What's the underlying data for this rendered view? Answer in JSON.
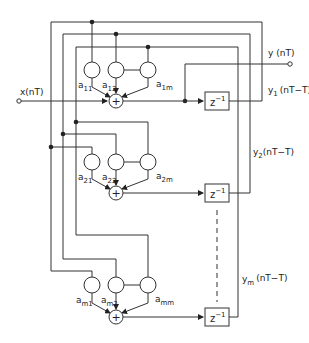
{
  "diagram": {
    "type": "signal-flow block diagram",
    "input": {
      "label": "x(nT)"
    },
    "output": {
      "label": "y (nT)"
    },
    "delay": {
      "label": "z",
      "exp": "−1"
    },
    "sum_symbol": "+",
    "rows": [
      {
        "coefficients": [
          {
            "base": "a",
            "sub": "11"
          },
          {
            "base": "a",
            "sub": "12"
          },
          {
            "base": "a",
            "sub": "1m"
          }
        ],
        "state": {
          "base": "y",
          "sub": "1",
          "arg": "(nT−T)"
        }
      },
      {
        "coefficients": [
          {
            "base": "a",
            "sub": "21"
          },
          {
            "base": "a",
            "sub": "22"
          },
          {
            "base": "a",
            "sub": "2m"
          }
        ],
        "state": {
          "base": "y",
          "sub": "2",
          "arg": "(nT−T)"
        }
      },
      {
        "coefficients": [
          {
            "base": "a",
            "sub": "m1"
          },
          {
            "base": "a",
            "sub": "m2"
          },
          {
            "base": "a",
            "sub": "mm"
          }
        ],
        "state": {
          "base": "y",
          "sub": "m",
          "arg": "(nT−T)"
        }
      }
    ]
  }
}
